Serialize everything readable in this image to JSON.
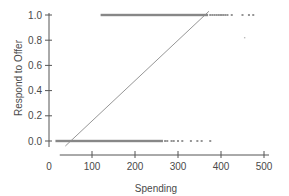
{
  "chart_data": {
    "type": "scatter",
    "title": "",
    "xlabel": "Spending",
    "ylabel": "Respond to Offer",
    "xlim": [
      0,
      500
    ],
    "ylim": [
      0,
      1
    ],
    "xticks": [
      "0",
      "100",
      "200",
      "300",
      "400",
      "500"
    ],
    "yticks": [
      "0.0",
      "0.2",
      "0.4",
      "0.6",
      "0.8",
      "1.0"
    ],
    "grid": false,
    "legend": null,
    "series": [
      {
        "name": "Responded (1)",
        "y": 1,
        "x_dense_range": [
          120,
          370
        ],
        "x_sparse": [
          375,
          380,
          385,
          390,
          395,
          400,
          405,
          410,
          415,
          425,
          450,
          465,
          475
        ]
      },
      {
        "name": "Did not respond (0)",
        "y": 0,
        "x_dense_range": [
          15,
          265
        ],
        "x_sparse": [
          270,
          275,
          285,
          290,
          300,
          310,
          330,
          345,
          355,
          375
        ]
      }
    ],
    "outlier_points": [
      {
        "x": 455,
        "y": 0.82
      }
    ],
    "fit_line": {
      "type": "linear",
      "points": [
        {
          "x": 38,
          "y": -0.04
        },
        {
          "x": 372,
          "y": 1.03
        }
      ]
    },
    "colors": {
      "points": "#7a7a7a",
      "line": "#8a8a8a",
      "axis": "#555555"
    }
  }
}
